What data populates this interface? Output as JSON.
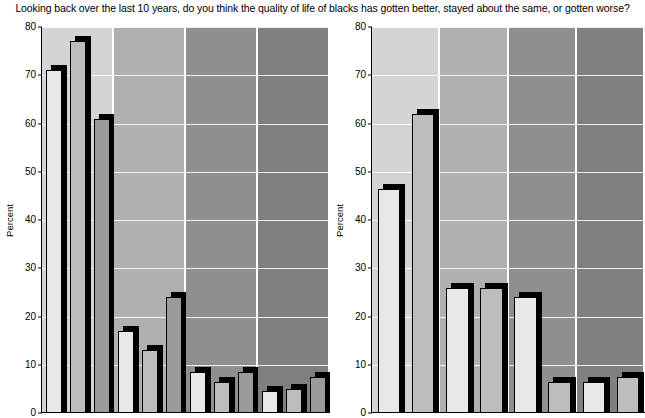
{
  "title": "Looking back over the last 10 years, do you think the quality of life of blacks has gotten better, stayed about the same, or gotten worse?",
  "axis": {
    "y_title": "Percent",
    "ticks": [
      "0",
      "10",
      "20",
      "30",
      "40",
      "50",
      "60",
      "70",
      "80"
    ]
  },
  "colors": {
    "panel_bg_1": "#d4d4d4",
    "panel_bg_2": "#b0b0b0",
    "panel_bg_3": "#8f8f8f",
    "panel_bg_4": "#808080",
    "bar_fill_1": "#e8e8e8",
    "bar_fill_2": "#bdbdbd",
    "bar_fill_3": "#9a9a9a",
    "bar_shadow": "#000000",
    "gridline": "#ffffff",
    "axis": "#000000"
  },
  "chart_data": [
    {
      "type": "bar",
      "title": "Looking back over the last 10 years, do you think the quality of life of blacks has gotten better, stayed about the same, or gotten worse?",
      "panel": "left",
      "xlabel": "",
      "ylabel": "Percent",
      "ylim": [
        0,
        80
      ],
      "yticks": [
        0,
        10,
        20,
        30,
        40,
        50,
        60,
        70,
        80
      ],
      "grid": true,
      "legend": "none",
      "categories": [
        "Group 1",
        "Group 2",
        "Group 3",
        "Group 4"
      ],
      "series": [
        {
          "name": "Series 1",
          "values": [
            71,
            17,
            8.5,
            4.5
          ]
        },
        {
          "name": "Series 2",
          "values": [
            77,
            13,
            6.5,
            5
          ]
        },
        {
          "name": "Series 3",
          "values": [
            61,
            24,
            8.5,
            7.5
          ]
        }
      ]
    },
    {
      "type": "bar",
      "panel": "right",
      "xlabel": "",
      "ylabel": "Percent",
      "ylim": [
        0,
        80
      ],
      "yticks": [
        0,
        10,
        20,
        30,
        40,
        50,
        60,
        70,
        80
      ],
      "grid": true,
      "legend": "none",
      "categories": [
        "Group 1",
        "Group 2",
        "Group 3",
        "Group 4"
      ],
      "series": [
        {
          "name": "Series 1",
          "values": [
            46.5,
            26,
            24,
            6.5
          ]
        },
        {
          "name": "Series 2",
          "values": [
            62,
            26,
            6.5,
            7.5
          ]
        }
      ]
    }
  ]
}
